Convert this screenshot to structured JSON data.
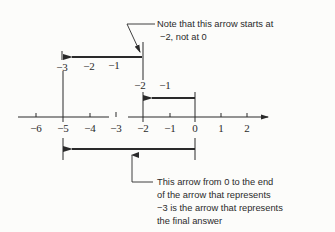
{
  "diagram": {
    "type": "number-line-addition",
    "expression": "-2 + (-3) = -5",
    "axis": {
      "ticks": [
        "-6",
        "-5",
        "-4",
        "-3",
        "-2",
        "-1",
        "0",
        "1",
        "2"
      ]
    },
    "arrow_minus2": {
      "labels": [
        "-2",
        "-1"
      ],
      "from": 0,
      "to": -2
    },
    "arrow_minus3": {
      "labels": [
        "-3",
        "-2",
        "-1"
      ],
      "from": -2,
      "to": -5
    },
    "result_arrow": {
      "from": 0,
      "to": -5
    },
    "callout_top": {
      "line1": "Note that this arrow starts at",
      "line2": "−2, not at 0"
    },
    "callout_bottom": {
      "line1": "This arrow from 0 to the end",
      "line2": "of the arrow that represents",
      "line3": "−3 is the arrow that represents",
      "line4": "the final answer"
    }
  },
  "colors": {
    "ink": "#2a2a2a",
    "background": "#fcfcfa"
  }
}
